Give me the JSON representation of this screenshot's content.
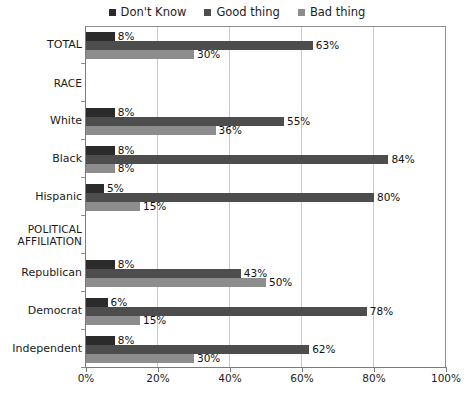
{
  "chart_data": {
    "type": "bar",
    "orientation": "horizontal",
    "title": "",
    "xlabel": "",
    "ylabel": "",
    "xlim": [
      0,
      100
    ],
    "xticks": [
      "0%",
      "20%",
      "40%",
      "60%",
      "80%",
      "100%"
    ],
    "xtick_values": [
      0,
      20,
      40,
      60,
      80,
      100
    ],
    "grid": true,
    "grid_axis": "x",
    "legend_position": "top-center",
    "value_label_suffix": "%",
    "series": [
      {
        "name": "Don't Know",
        "color": "#2b2b2b",
        "values": [
          8,
          null,
          8,
          8,
          5,
          null,
          8,
          6,
          8
        ]
      },
      {
        "name": "Good thing",
        "color": "#4d4d4d",
        "values": [
          63,
          null,
          55,
          84,
          80,
          null,
          43,
          78,
          62
        ]
      },
      {
        "name": "Bad thing",
        "color": "#8d8d8d",
        "values": [
          30,
          null,
          36,
          8,
          15,
          null,
          50,
          15,
          30
        ]
      }
    ],
    "categories": [
      "TOTAL",
      "RACE",
      "White",
      "Black",
      "Hispanic",
      "POLITICAL AFFILIATION",
      "Republican",
      "Democrat",
      "Independent"
    ],
    "rows": [
      {
        "label": "TOTAL",
        "is_section": false,
        "dont_know": "8%",
        "good_thing": "63%",
        "bad_thing": "30%",
        "dont_know_value": 8,
        "good_thing_value": 63,
        "bad_thing_value": 30
      },
      {
        "label": "RACE",
        "is_section": true,
        "dont_know": "",
        "good_thing": "",
        "bad_thing": ""
      },
      {
        "label": "White",
        "is_section": false,
        "dont_know": "8%",
        "good_thing": "55%",
        "bad_thing": "36%",
        "dont_know_value": 8,
        "good_thing_value": 55,
        "bad_thing_value": 36
      },
      {
        "label": "Black",
        "is_section": false,
        "dont_know": "8%",
        "good_thing": "84%",
        "bad_thing": "8%",
        "dont_know_value": 8,
        "good_thing_value": 84,
        "bad_thing_value": 8
      },
      {
        "label": "Hispanic",
        "is_section": false,
        "dont_know": "5%",
        "good_thing": "80%",
        "bad_thing": "15%",
        "dont_know_value": 5,
        "good_thing_value": 80,
        "bad_thing_value": 15
      },
      {
        "label": "POLITICAL\nAFFILIATION",
        "is_section": true,
        "dont_know": "",
        "good_thing": "",
        "bad_thing": ""
      },
      {
        "label": "Republican",
        "is_section": false,
        "dont_know": "8%",
        "good_thing": "43%",
        "bad_thing": "50%",
        "dont_know_value": 8,
        "good_thing_value": 43,
        "bad_thing_value": 50
      },
      {
        "label": "Democrat",
        "is_section": false,
        "dont_know": "6%",
        "good_thing": "78%",
        "bad_thing": "15%",
        "dont_know_value": 6,
        "good_thing_value": 78,
        "bad_thing_value": 15
      },
      {
        "label": "Independent",
        "is_section": false,
        "dont_know": "8%",
        "good_thing": "62%",
        "bad_thing": "30%",
        "dont_know_value": 8,
        "good_thing_value": 62,
        "bad_thing_value": 30
      }
    ]
  },
  "legend": {
    "items": [
      {
        "label": "Don't Know",
        "color": "#2b2b2b"
      },
      {
        "label": "Good thing",
        "color": "#4d4d4d"
      },
      {
        "label": "Bad thing",
        "color": "#8d8d8d"
      }
    ]
  }
}
